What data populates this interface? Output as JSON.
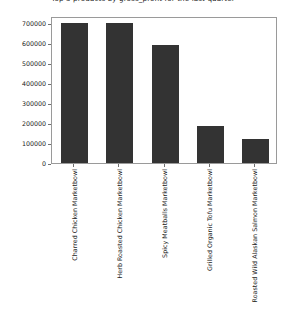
{
  "chart_data": {
    "type": "bar",
    "title": "Top 5 products by gross_profit for the last quarter",
    "xlabel": "",
    "ylabel": "",
    "categories": [
      "Charred Chicken Marketbowl",
      "Herb Roasted Chicken Marketbowl",
      "Spicy Meatballs Marketbowl",
      "Grilled Organic Tofu Marketbowl",
      "Roasted Wild Alaskan Salmon Marketbowl"
    ],
    "values": [
      700000,
      700000,
      592000,
      185000,
      120000
    ],
    "ylim": [
      0,
      735000
    ],
    "yticks": [
      0,
      100000,
      200000,
      300000,
      400000,
      500000,
      600000,
      700000
    ],
    "ytick_labels": [
      "0",
      "100000",
      "200000",
      "300000",
      "400000",
      "500000",
      "600000",
      "700000"
    ],
    "grid": false,
    "legend": false,
    "bar_color": "#333333",
    "axis_color": "#9a9a9a",
    "background": "#ffffff"
  }
}
